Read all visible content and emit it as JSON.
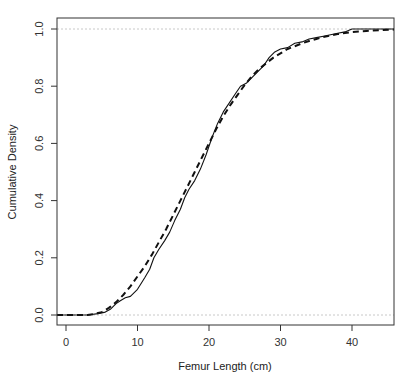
{
  "chart_data": {
    "type": "line",
    "title": "",
    "xlabel": "Femur Length (cm)",
    "ylabel": "Cumulative Density",
    "xlim": [
      -2,
      46
    ],
    "ylim": [
      -0.04,
      1.04
    ],
    "x_ticks": [
      0,
      10,
      20,
      30,
      40
    ],
    "x_tick_labels": [
      "0",
      "10",
      "20",
      "30",
      "40"
    ],
    "y_ticks": [
      0.0,
      0.2,
      0.4,
      0.6,
      0.8,
      1.0
    ],
    "y_tick_labels": [
      "0.0",
      "0.2",
      "0.4",
      "0.6",
      "0.8",
      "1.0"
    ],
    "grid": false,
    "reference_lines": [
      {
        "y": 0.0,
        "style": "dotted",
        "color": "#c8c8c8"
      },
      {
        "y": 1.0,
        "style": "dotted",
        "color": "#c8c8c8"
      }
    ],
    "series": [
      {
        "name": "Empirical CDF",
        "style": "solid",
        "color": "#111111",
        "x": [
          -2,
          3,
          4.5,
          5.5,
          6.2,
          7,
          7.6,
          8.3,
          9,
          10,
          11,
          11.7,
          12.3,
          13,
          13.8,
          14.5,
          15.2,
          16,
          16.6,
          17.2,
          18,
          18.8,
          19.6,
          20.4,
          21.2,
          22,
          22.8,
          23.6,
          24.4,
          25.2,
          26,
          26.8,
          27.6,
          28.4,
          29.2,
          30,
          31,
          32,
          33,
          34,
          35,
          36,
          37,
          38,
          39,
          40,
          42,
          44,
          46
        ],
        "y": [
          0.0,
          0.0,
          0.005,
          0.01,
          0.02,
          0.04,
          0.05,
          0.06,
          0.065,
          0.09,
          0.13,
          0.16,
          0.2,
          0.23,
          0.26,
          0.29,
          0.33,
          0.37,
          0.41,
          0.44,
          0.47,
          0.51,
          0.56,
          0.62,
          0.67,
          0.71,
          0.74,
          0.77,
          0.8,
          0.81,
          0.83,
          0.85,
          0.87,
          0.9,
          0.92,
          0.93,
          0.935,
          0.95,
          0.955,
          0.965,
          0.97,
          0.975,
          0.98,
          0.985,
          0.99,
          1.0,
          1.0,
          1.0,
          1.0
        ]
      },
      {
        "name": "Fitted CDF",
        "style": "dashed",
        "color": "#111111",
        "x": [
          -2,
          3,
          4,
          5,
          6,
          7,
          8,
          9,
          10,
          11,
          12,
          13,
          14,
          15,
          16,
          17,
          18,
          19,
          20,
          21,
          22,
          23,
          24,
          25,
          26,
          27,
          28,
          29,
          30,
          31,
          32,
          33,
          34,
          35,
          36,
          37,
          38,
          39,
          40,
          42,
          44,
          46
        ],
        "y": [
          0.0,
          0.0,
          0.004,
          0.01,
          0.025,
          0.045,
          0.07,
          0.1,
          0.135,
          0.17,
          0.21,
          0.255,
          0.3,
          0.35,
          0.4,
          0.45,
          0.5,
          0.55,
          0.6,
          0.65,
          0.695,
          0.735,
          0.77,
          0.805,
          0.835,
          0.86,
          0.88,
          0.9,
          0.915,
          0.93,
          0.94,
          0.95,
          0.958,
          0.965,
          0.972,
          0.977,
          0.982,
          0.986,
          0.989,
          0.993,
          0.996,
          0.998
        ]
      }
    ]
  },
  "labels": {
    "xlabel": "Femur Length (cm)",
    "ylabel": "Cumulative Density",
    "x_ticks": [
      "0",
      "10",
      "20",
      "30",
      "40"
    ],
    "y_ticks": [
      "0.0",
      "0.2",
      "0.4",
      "0.6",
      "0.8",
      "1.0"
    ]
  }
}
